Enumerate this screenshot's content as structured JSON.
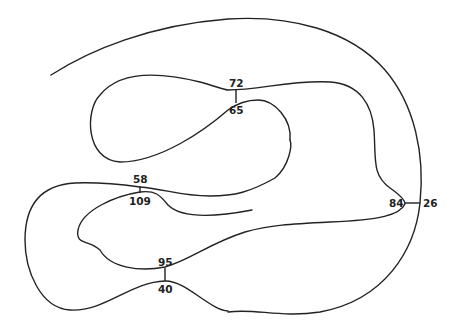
{
  "diagram": {
    "type": "closed-curve-with-crossing-markers",
    "line_color": "#222222",
    "background": "#ffffff",
    "markers": [
      {
        "id": "m1",
        "upper": "72",
        "lower": "65"
      },
      {
        "id": "m2",
        "upper": "58",
        "lower": "109"
      },
      {
        "id": "m3",
        "left": "84",
        "right": "26"
      },
      {
        "id": "m4",
        "upper": "95",
        "lower": "40"
      }
    ]
  }
}
